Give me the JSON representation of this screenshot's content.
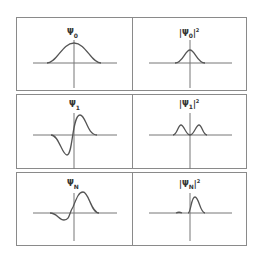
{
  "panels": [
    {
      "id": "psi0",
      "symbol": "Ψ",
      "sub": "0",
      "squared": false
    },
    {
      "id": "psi0sq",
      "symbol": "|Ψ",
      "sub": "0",
      "squared": true,
      "sup": "2"
    },
    {
      "id": "psi1",
      "symbol": "Ψ",
      "sub": "1",
      "squared": false
    },
    {
      "id": "psi1sq",
      "symbol": "|Ψ",
      "sub": "1",
      "squared": true,
      "sup": "2"
    },
    {
      "id": "psiN",
      "symbol": "Ψ",
      "sub": "N",
      "squared": false
    },
    {
      "id": "psiNsq",
      "symbol": "|Ψ",
      "sub": "N",
      "squared": true,
      "sup": "2"
    }
  ],
  "colors": {
    "curve": "#555555",
    "axis": "#777777",
    "border": "#8a8a8a"
  }
}
